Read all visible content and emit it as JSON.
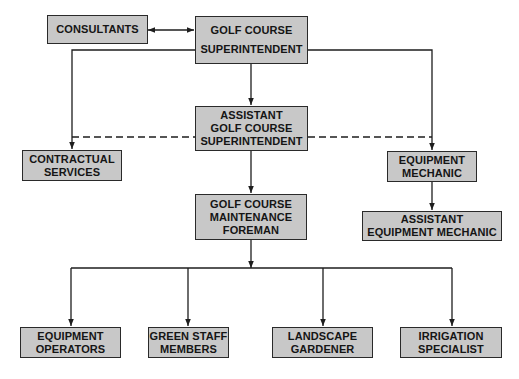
{
  "diagram": {
    "type": "organizational-chart",
    "nodes": {
      "consultants": {
        "lines": [
          "CONSULTANTS"
        ]
      },
      "superintendent": {
        "lines": [
          "GOLF COURSE",
          "SUPERINTENDENT"
        ]
      },
      "assistant_superintendent": {
        "lines": [
          "ASSISTANT",
          "GOLF COURSE",
          "SUPERINTENDENT"
        ]
      },
      "contractual_services": {
        "lines": [
          "CONTRACTUAL",
          "SERVICES"
        ]
      },
      "equipment_mechanic": {
        "lines": [
          "EQUIPMENT",
          "MECHANIC"
        ]
      },
      "maintenance_foreman": {
        "lines": [
          "GOLF COURSE",
          "MAINTENANCE",
          "FOREMAN"
        ]
      },
      "assistant_equipment_mechanic": {
        "lines": [
          "ASSISTANT",
          "EQUIPMENT MECHANIC"
        ]
      },
      "equipment_operators": {
        "lines": [
          "EQUIPMENT",
          "OPERATORS"
        ]
      },
      "green_staff_members": {
        "lines": [
          "GREEN STAFF",
          "MEMBERS"
        ]
      },
      "landscape_gardener": {
        "lines": [
          "LANDSCAPE",
          "GARDENER"
        ]
      },
      "irrigation_specialist": {
        "lines": [
          "IRRIGATION",
          "SPECIALIST"
        ]
      }
    },
    "edges": [
      {
        "from": "consultants",
        "to": "superintendent",
        "style": "solid",
        "bidirectional": true
      },
      {
        "from": "superintendent",
        "to": "assistant_superintendent",
        "style": "solid"
      },
      {
        "from": "superintendent",
        "to": "contractual_services",
        "style": "solid"
      },
      {
        "from": "superintendent",
        "to": "equipment_mechanic",
        "style": "solid"
      },
      {
        "from": "assistant_superintendent",
        "to": "contractual_services",
        "style": "dashed"
      },
      {
        "from": "assistant_superintendent",
        "to": "equipment_mechanic",
        "style": "dashed"
      },
      {
        "from": "assistant_superintendent",
        "to": "maintenance_foreman",
        "style": "solid"
      },
      {
        "from": "equipment_mechanic",
        "to": "assistant_equipment_mechanic",
        "style": "solid"
      },
      {
        "from": "maintenance_foreman",
        "to": "equipment_operators",
        "style": "solid"
      },
      {
        "from": "maintenance_foreman",
        "to": "green_staff_members",
        "style": "solid"
      },
      {
        "from": "maintenance_foreman",
        "to": "landscape_gardener",
        "style": "solid"
      },
      {
        "from": "maintenance_foreman",
        "to": "irrigation_specialist",
        "style": "solid"
      }
    ],
    "colors": {
      "box_fill": "#c8c8c8",
      "line": "#1e1e1e",
      "background": "#ffffff"
    }
  }
}
